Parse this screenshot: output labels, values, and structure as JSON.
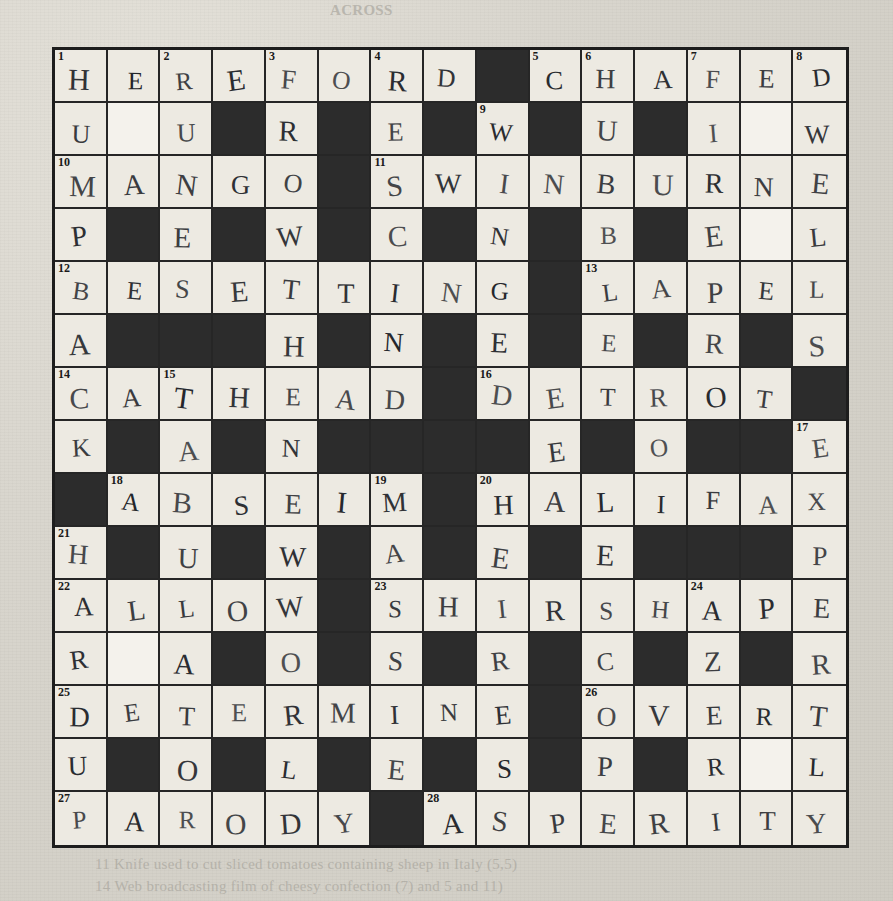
{
  "page": {
    "type": "crossword-puzzle",
    "title": "ACROSS",
    "grid_size": 15,
    "colors": {
      "paper": "#d8d5cd",
      "cell_white": "#edeae2",
      "cell_block": "#2c2c2c",
      "ink": "#23252a"
    }
  },
  "bleed_text": {
    "top": "ACROSS",
    "line1": "11  Knife used to cut sliced tomatoes containing sheep in Italy (5,5)",
    "line2": "14  Web broadcasting film of cheesy confection (7) and 5 and 11)"
  },
  "grid": {
    "rows": [
      [
        {
          "s": "w",
          "n": "1",
          "l": "H"
        },
        {
          "s": "w",
          "l": "E"
        },
        {
          "s": "w",
          "n": "2",
          "l": "R"
        },
        {
          "s": "w",
          "l": "E"
        },
        {
          "s": "w",
          "n": "3",
          "l": "F"
        },
        {
          "s": "w",
          "l": "O"
        },
        {
          "s": "w",
          "n": "4",
          "l": "R"
        },
        {
          "s": "w",
          "l": "D"
        },
        {
          "s": "b"
        },
        {
          "s": "w",
          "n": "5",
          "l": "C"
        },
        {
          "s": "w",
          "n": "6",
          "l": "H"
        },
        {
          "s": "w",
          "l": "A"
        },
        {
          "s": "w",
          "n": "7",
          "l": "F"
        },
        {
          "s": "w",
          "l": "E"
        },
        {
          "s": "w",
          "n": "8",
          "l": "D"
        }
      ],
      [
        {
          "s": "w",
          "l": "U"
        },
        {
          "s": "k"
        },
        {
          "s": "w",
          "l": "U"
        },
        {
          "s": "b"
        },
        {
          "s": "w",
          "l": "R"
        },
        {
          "s": "b"
        },
        {
          "s": "w",
          "l": "E"
        },
        {
          "s": "b"
        },
        {
          "s": "w",
          "n": "9",
          "l": "W"
        },
        {
          "s": "b"
        },
        {
          "s": "w",
          "l": "U"
        },
        {
          "s": "b"
        },
        {
          "s": "w",
          "l": "I"
        },
        {
          "s": "k"
        },
        {
          "s": "w",
          "l": "W"
        }
      ],
      [
        {
          "s": "w",
          "n": "10",
          "l": "M"
        },
        {
          "s": "w",
          "l": "A"
        },
        {
          "s": "w",
          "l": "N"
        },
        {
          "s": "w",
          "l": "G"
        },
        {
          "s": "w",
          "l": "O"
        },
        {
          "s": "b"
        },
        {
          "s": "w",
          "n": "11",
          "l": "S"
        },
        {
          "s": "w",
          "l": "W"
        },
        {
          "s": "w",
          "l": "I"
        },
        {
          "s": "w",
          "l": "N"
        },
        {
          "s": "w",
          "l": "B"
        },
        {
          "s": "w",
          "l": "U"
        },
        {
          "s": "w",
          "l": "R"
        },
        {
          "s": "w",
          "l": "N"
        },
        {
          "s": "w",
          "l": "E"
        }
      ],
      [
        {
          "s": "w",
          "l": "P"
        },
        {
          "s": "b"
        },
        {
          "s": "w",
          "l": "E"
        },
        {
          "s": "b"
        },
        {
          "s": "w",
          "l": "W"
        },
        {
          "s": "b"
        },
        {
          "s": "w",
          "l": "C"
        },
        {
          "s": "b"
        },
        {
          "s": "w",
          "l": "N"
        },
        {
          "s": "b"
        },
        {
          "s": "w",
          "l": "B"
        },
        {
          "s": "b"
        },
        {
          "s": "w",
          "l": "E"
        },
        {
          "s": "k"
        },
        {
          "s": "w",
          "l": "L"
        }
      ],
      [
        {
          "s": "w",
          "n": "12",
          "l": "B"
        },
        {
          "s": "w",
          "l": "E"
        },
        {
          "s": "w",
          "l": "S"
        },
        {
          "s": "w",
          "l": "E"
        },
        {
          "s": "w",
          "l": "T"
        },
        {
          "s": "w",
          "l": "T"
        },
        {
          "s": "w",
          "l": "I"
        },
        {
          "s": "w",
          "l": "N"
        },
        {
          "s": "w",
          "l": "G"
        },
        {
          "s": "b"
        },
        {
          "s": "w",
          "n": "13",
          "l": "L"
        },
        {
          "s": "w",
          "l": "A"
        },
        {
          "s": "w",
          "l": "P"
        },
        {
          "s": "w",
          "l": "E"
        },
        {
          "s": "w",
          "l": "L"
        }
      ],
      [
        {
          "s": "w",
          "l": "A"
        },
        {
          "s": "b"
        },
        {
          "s": "b"
        },
        {
          "s": "b"
        },
        {
          "s": "w",
          "l": "H"
        },
        {
          "s": "b"
        },
        {
          "s": "w",
          "l": "N"
        },
        {
          "s": "b"
        },
        {
          "s": "w",
          "l": "E"
        },
        {
          "s": "b"
        },
        {
          "s": "w",
          "l": "E"
        },
        {
          "s": "b"
        },
        {
          "s": "w",
          "l": "R"
        },
        {
          "s": "b"
        },
        {
          "s": "w",
          "l": "S"
        }
      ],
      [
        {
          "s": "w",
          "n": "14",
          "l": "C"
        },
        {
          "s": "w",
          "l": "A"
        },
        {
          "s": "w",
          "n": "15",
          "l": "T"
        },
        {
          "s": "w",
          "l": "H"
        },
        {
          "s": "w",
          "l": "E"
        },
        {
          "s": "w",
          "l": "A"
        },
        {
          "s": "w",
          "l": "D"
        },
        {
          "s": "b"
        },
        {
          "s": "w",
          "n": "16",
          "l": "D"
        },
        {
          "s": "w",
          "l": "E"
        },
        {
          "s": "w",
          "l": "T"
        },
        {
          "s": "w",
          "l": "R"
        },
        {
          "s": "w",
          "l": "O"
        },
        {
          "s": "w",
          "l": "T"
        },
        {
          "s": "b"
        }
      ],
      [
        {
          "s": "w",
          "l": "K"
        },
        {
          "s": "b"
        },
        {
          "s": "w",
          "l": "A"
        },
        {
          "s": "b"
        },
        {
          "s": "w",
          "l": "N"
        },
        {
          "s": "b"
        },
        {
          "s": "b"
        },
        {
          "s": "b"
        },
        {
          "s": "b"
        },
        {
          "s": "w",
          "l": "E"
        },
        {
          "s": "b"
        },
        {
          "s": "w",
          "l": "O"
        },
        {
          "s": "b"
        },
        {
          "s": "b"
        },
        {
          "s": "w",
          "n": "17",
          "l": "E"
        }
      ],
      [
        {
          "s": "b"
        },
        {
          "s": "w",
          "n": "18",
          "l": "A"
        },
        {
          "s": "w",
          "l": "B"
        },
        {
          "s": "w",
          "l": "S"
        },
        {
          "s": "w",
          "l": "E"
        },
        {
          "s": "w",
          "l": "I"
        },
        {
          "s": "w",
          "n": "19",
          "l": "M"
        },
        {
          "s": "b"
        },
        {
          "s": "w",
          "n": "20",
          "l": "H"
        },
        {
          "s": "w",
          "l": "A"
        },
        {
          "s": "w",
          "l": "L"
        },
        {
          "s": "w",
          "l": "I"
        },
        {
          "s": "w",
          "l": "F"
        },
        {
          "s": "w",
          "l": "A"
        },
        {
          "s": "w",
          "l": "X"
        }
      ],
      [
        {
          "s": "w",
          "n": "21",
          "l": "H"
        },
        {
          "s": "b"
        },
        {
          "s": "w",
          "l": "U"
        },
        {
          "s": "b"
        },
        {
          "s": "w",
          "l": "W"
        },
        {
          "s": "b"
        },
        {
          "s": "w",
          "l": "A"
        },
        {
          "s": "b"
        },
        {
          "s": "w",
          "l": "E"
        },
        {
          "s": "b"
        },
        {
          "s": "w",
          "l": "E"
        },
        {
          "s": "b"
        },
        {
          "s": "b"
        },
        {
          "s": "b"
        },
        {
          "s": "w",
          "l": "P"
        }
      ],
      [
        {
          "s": "w",
          "n": "22",
          "l": "A"
        },
        {
          "s": "w",
          "l": "L"
        },
        {
          "s": "w",
          "l": "L"
        },
        {
          "s": "w",
          "l": "O"
        },
        {
          "s": "w",
          "l": "W"
        },
        {
          "s": "b"
        },
        {
          "s": "w",
          "n": "23",
          "l": "S"
        },
        {
          "s": "w",
          "l": "H"
        },
        {
          "s": "w",
          "l": "I"
        },
        {
          "s": "w",
          "l": "R"
        },
        {
          "s": "w",
          "l": "S"
        },
        {
          "s": "w",
          "l": "H"
        },
        {
          "s": "w",
          "n": "24",
          "l": "A"
        },
        {
          "s": "w",
          "l": "P"
        },
        {
          "s": "w",
          "l": "E"
        }
      ],
      [
        {
          "s": "w",
          "l": "R"
        },
        {
          "s": "k"
        },
        {
          "s": "w",
          "l": "A"
        },
        {
          "s": "b"
        },
        {
          "s": "w",
          "l": "O"
        },
        {
          "s": "b"
        },
        {
          "s": "w",
          "l": "S"
        },
        {
          "s": "b"
        },
        {
          "s": "w",
          "l": "R"
        },
        {
          "s": "b"
        },
        {
          "s": "w",
          "l": "C"
        },
        {
          "s": "b"
        },
        {
          "s": "w",
          "l": "Z"
        },
        {
          "s": "b"
        },
        {
          "s": "w",
          "l": "R"
        }
      ],
      [
        {
          "s": "w",
          "n": "25",
          "l": "D"
        },
        {
          "s": "w",
          "l": "E"
        },
        {
          "s": "w",
          "l": "T"
        },
        {
          "s": "w",
          "l": "E"
        },
        {
          "s": "w",
          "l": "R"
        },
        {
          "s": "w",
          "l": "M"
        },
        {
          "s": "w",
          "l": "I"
        },
        {
          "s": "w",
          "l": "N"
        },
        {
          "s": "w",
          "l": "E"
        },
        {
          "s": "b"
        },
        {
          "s": "w",
          "n": "26",
          "l": "O"
        },
        {
          "s": "w",
          "l": "V"
        },
        {
          "s": "w",
          "l": "E"
        },
        {
          "s": "w",
          "l": "R"
        },
        {
          "s": "w",
          "l": "T"
        }
      ],
      [
        {
          "s": "w",
          "l": "U"
        },
        {
          "s": "b"
        },
        {
          "s": "w",
          "l": "O"
        },
        {
          "s": "b"
        },
        {
          "s": "w",
          "l": "L"
        },
        {
          "s": "b"
        },
        {
          "s": "w",
          "l": "E"
        },
        {
          "s": "b"
        },
        {
          "s": "w",
          "l": "S"
        },
        {
          "s": "b"
        },
        {
          "s": "w",
          "l": "P"
        },
        {
          "s": "b"
        },
        {
          "s": "w",
          "l": "R"
        },
        {
          "s": "k"
        },
        {
          "s": "w",
          "l": "L"
        }
      ],
      [
        {
          "s": "w",
          "n": "27",
          "l": "P"
        },
        {
          "s": "w",
          "l": "A"
        },
        {
          "s": "w",
          "l": "R"
        },
        {
          "s": "w",
          "l": "O"
        },
        {
          "s": "w",
          "l": "D"
        },
        {
          "s": "w",
          "l": "Y"
        },
        {
          "s": "b"
        },
        {
          "s": "w",
          "n": "28",
          "l": "A"
        },
        {
          "s": "w",
          "l": "S"
        },
        {
          "s": "w",
          "l": "P"
        },
        {
          "s": "w",
          "l": "E"
        },
        {
          "s": "w",
          "l": "R"
        },
        {
          "s": "w",
          "l": "I"
        },
        {
          "s": "w",
          "l": "T"
        },
        {
          "s": "w",
          "l": "Y"
        }
      ]
    ]
  }
}
